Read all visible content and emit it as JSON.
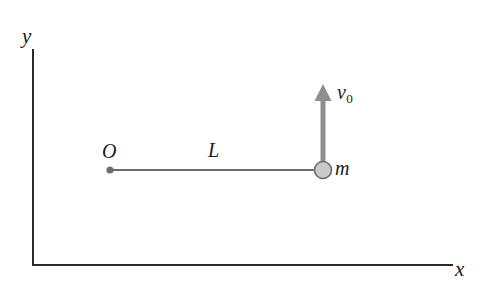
{
  "figure": {
    "kind": "physics-diagram",
    "background_color": "#ffffff"
  },
  "axes": {
    "x_label": "x",
    "y_label": "y",
    "color": "#2b2b2b",
    "origin_px": {
      "x": 33,
      "y": 265
    },
    "x_end_px": 452,
    "y_top_px": 50
  },
  "pivot": {
    "label": "O",
    "color": "#6e6e6e",
    "center_px": {
      "x": 110,
      "y": 170
    },
    "radius_px": 3.6
  },
  "rod": {
    "label": "L",
    "color": "#3a3a3a",
    "from_px": {
      "x": 110,
      "y": 170
    },
    "to_px": {
      "x": 316,
      "y": 170
    },
    "thickness_px": 1.6
  },
  "mass": {
    "label": "m",
    "fill_color": "#c9c9c9",
    "stroke_color": "#6b6b6b",
    "center_px": {
      "x": 323,
      "y": 170
    },
    "radius_px": 8.5
  },
  "velocity_arrow": {
    "label": "v",
    "subscript": "0",
    "color": "#8f8f8f",
    "direction": "up",
    "tail_px": {
      "x": 323,
      "y": 162
    },
    "tip_px": {
      "x": 323,
      "y": 84
    },
    "shaft_width_px": 5,
    "head_width_px": 15,
    "head_length_px": 16
  }
}
